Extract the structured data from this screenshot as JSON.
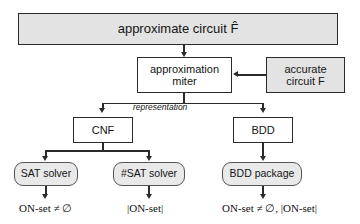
{
  "diagram": {
    "colors": {
      "box_fill_gray": "#e3e3e3",
      "box_fill_white": "#ffffff",
      "rounded_fill": "#e9e9e9",
      "stroke": "#2b2b2b",
      "background": "#ffffff"
    },
    "nodes": {
      "approx_circuit": {
        "label": "approximate circuit F̂",
        "shape": "rectangle",
        "fill": "gray"
      },
      "approximation_miter": {
        "line1": "approximation",
        "line2": "miter",
        "shape": "rectangle",
        "fill": "white"
      },
      "accurate_circuit": {
        "line1": "accurate",
        "line2": "circuit F",
        "shape": "rectangle",
        "fill": "gray"
      },
      "cnf": {
        "label": "CNF",
        "shape": "rectangle",
        "fill": "white"
      },
      "bdd": {
        "label": "BDD",
        "shape": "rectangle",
        "fill": "white"
      },
      "sat_solver": {
        "label": "SAT solver",
        "shape": "rounded",
        "fill": "gray"
      },
      "sharp_sat_solver": {
        "label": "#SAT solver",
        "shape": "rounded",
        "fill": "gray"
      },
      "bdd_package": {
        "label": "BDD package",
        "shape": "rounded",
        "fill": "gray"
      }
    },
    "edge_labels": {
      "representation": "representation"
    },
    "outputs": {
      "sat_result": "ON-set ≠ ∅",
      "sharp_sat_result": "|ON-set|",
      "bdd_result": "ON-set ≠ ∅, |ON-set|"
    }
  }
}
